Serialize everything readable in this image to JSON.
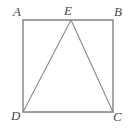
{
  "figure": {
    "background_color": "#ffffff",
    "stroke_color": "#808080",
    "label_color": "#4a4a4a",
    "stroke_width": 1,
    "labels": {
      "a": "A",
      "b": "B",
      "c": "C",
      "d": "D",
      "e": "E"
    },
    "points": {
      "A": {
        "x": 23,
        "y": 20
      },
      "B": {
        "x": 113,
        "y": 20
      },
      "C": {
        "x": 113,
        "y": 112
      },
      "D": {
        "x": 23,
        "y": 112
      },
      "E": {
        "x": 71,
        "y": 20
      }
    },
    "shapes": [
      {
        "name": "square-ABCD",
        "type": "polygon",
        "vertices": [
          "A",
          "B",
          "C",
          "D"
        ]
      },
      {
        "name": "segment-DE",
        "type": "line",
        "from": "D",
        "to": "E"
      },
      {
        "name": "segment-EC",
        "type": "line",
        "from": "E",
        "to": "C"
      }
    ]
  }
}
